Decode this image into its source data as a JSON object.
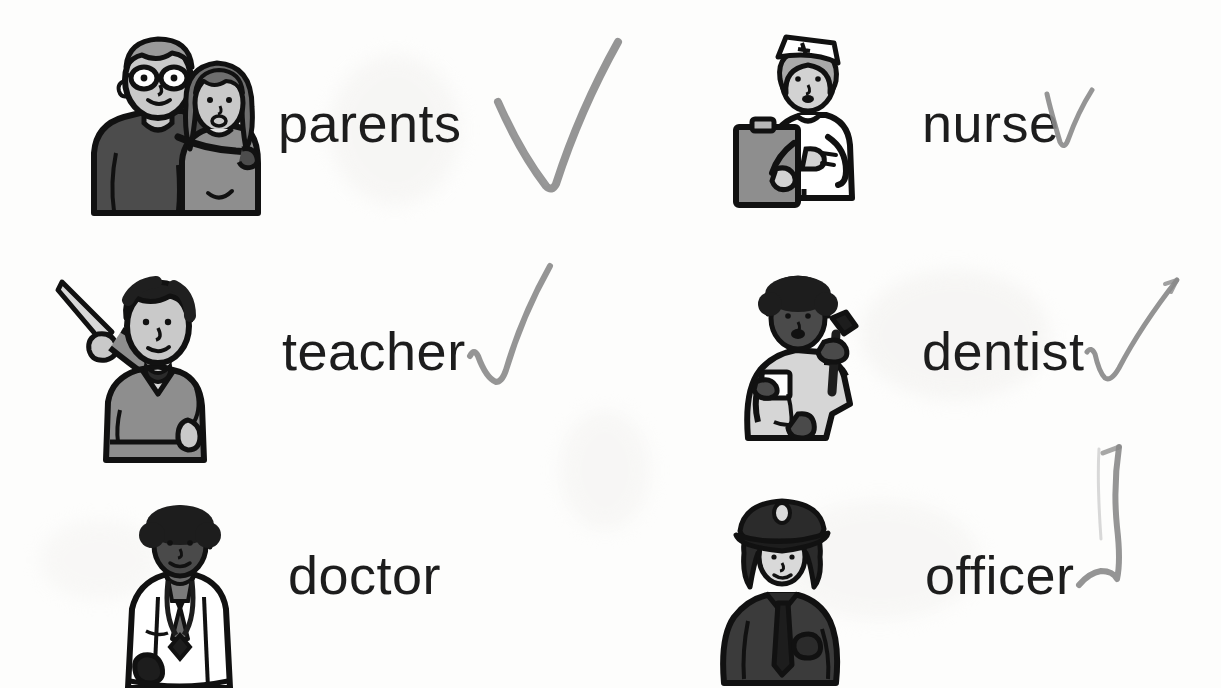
{
  "worksheet": {
    "title": "Community Helpers Vocabulary Worksheet",
    "background_color": "#fdfdfc",
    "text_color": "#1d1d1d",
    "pencil_color": "#8a8a8a"
  },
  "columns": [
    {
      "name": "left-column",
      "items": [
        {
          "id": "parents",
          "label": "parents",
          "icon": "parents-illustration",
          "checked": true,
          "check_style": "large-v",
          "label_x": 278,
          "label_y": 96,
          "pic_x": 86,
          "pic_y": 33,
          "pic_w": 176,
          "pic_h": 180,
          "mark_x": 490,
          "mark_y": 34,
          "mark_w": 140,
          "mark_h": 160
        },
        {
          "id": "teacher",
          "label": "teacher",
          "icon": "teacher-illustration",
          "checked": true,
          "check_style": "narrow-hook",
          "label_x": 282,
          "label_y": 324,
          "pic_x": 58,
          "pic_y": 270,
          "pic_w": 160,
          "pic_h": 190,
          "mark_x": 464,
          "mark_y": 262,
          "mark_w": 106,
          "mark_h": 124
        },
        {
          "id": "doctor",
          "label": "doctor",
          "icon": "doctor-illustration",
          "checked": false,
          "check_style": "none",
          "label_x": 288,
          "label_y": 548,
          "pic_x": 110,
          "pic_y": 505,
          "pic_w": 140,
          "pic_h": 183
        }
      ]
    },
    {
      "name": "right-column",
      "items": [
        {
          "id": "nurse",
          "label": "nurse",
          "icon": "nurse-illustration",
          "checked": true,
          "check_style": "small-v",
          "label_x": 922,
          "label_y": 96,
          "pic_x": 742,
          "pic_y": 33,
          "pic_w": 130,
          "pic_h": 165,
          "mark_x": 1044,
          "mark_y": 88,
          "mark_w": 52,
          "mark_h": 72
        },
        {
          "id": "dentist",
          "label": "dentist",
          "icon": "dentist-illustration",
          "checked": true,
          "check_style": "sweeping-curve",
          "label_x": 922,
          "label_y": 324,
          "pic_x": 736,
          "pic_y": 272,
          "pic_w": 140,
          "pic_h": 172,
          "mark_x": 1085,
          "mark_y": 268,
          "mark_w": 100,
          "mark_h": 122
        },
        {
          "id": "officer",
          "label": "officer",
          "icon": "police-officer-illustration",
          "checked": true,
          "check_style": "tall-stroke",
          "label_x": 925,
          "label_y": 548,
          "pic_x": 718,
          "pic_y": 495,
          "pic_w": 130,
          "pic_h": 188,
          "mark_x": 1075,
          "mark_y": 443,
          "mark_w": 110,
          "mark_h": 155
        }
      ]
    }
  ]
}
